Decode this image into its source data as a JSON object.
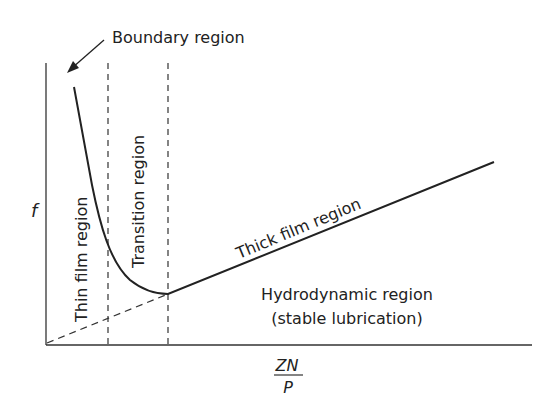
{
  "diagram": {
    "y_axis_label": "f",
    "x_axis_label": {
      "numerator": "ZN",
      "denominator": "P"
    },
    "annotations": {
      "boundary": "Boundary region",
      "thin_film": "Thin film region",
      "transition": "Transition region",
      "thick_film": "Thick film region",
      "hydrodynamic_line1": "Hydrodynamic region",
      "hydrodynamic_line2": "(stable lubrication)"
    },
    "colors": {
      "line": "#222222",
      "background": "#ffffff"
    }
  }
}
